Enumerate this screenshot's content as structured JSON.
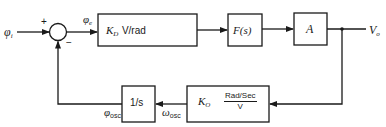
{
  "diagram": {
    "type": "control-loop-block-diagram",
    "input": {
      "symbol": "φ",
      "subscript": "i"
    },
    "summing_junction": {
      "plus_sign": "+",
      "minus_sign": "−"
    },
    "error_signal": {
      "symbol": "φ",
      "subscript": "e"
    },
    "blocks": [
      {
        "id": "phase-detector",
        "gain_symbol": "K",
        "gain_subscript": "D",
        "units": "V/rad"
      },
      {
        "id": "loop-filter",
        "label": "F(s)"
      },
      {
        "id": "amplifier",
        "label": "A"
      },
      {
        "id": "vco",
        "gain_symbol": "K",
        "gain_subscript": "O",
        "units_numerator": "Rad/Sec",
        "units_denominator": "V"
      },
      {
        "id": "integrator",
        "label": "1/s"
      }
    ],
    "output": {
      "symbol": "V",
      "subscript": "o"
    },
    "feedback_signals": {
      "omega": {
        "symbol": "ω",
        "subscript": "osc"
      },
      "phi": {
        "symbol": "φ",
        "subscript": "osc"
      }
    },
    "colors": {
      "line": "#1a1a1a",
      "background": "#ffffff"
    }
  }
}
